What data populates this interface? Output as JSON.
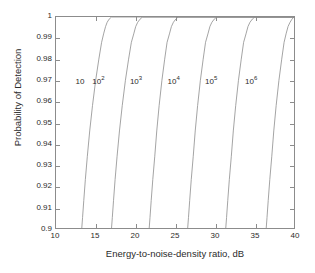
{
  "chart_data": {
    "type": "line",
    "title": "",
    "xlabel": "Energy-to-noise-density ratio, dB",
    "ylabel": "Probability of Detection",
    "xlim": [
      10,
      40
    ],
    "ylim": [
      0.9,
      1.0
    ],
    "xticks": [
      10,
      15,
      20,
      25,
      30,
      35,
      40
    ],
    "xtick_labels": [
      "10",
      "15",
      "20",
      "25",
      "30",
      "35",
      "40"
    ],
    "yticks": [
      0.9,
      0.91,
      0.92,
      0.93,
      0.94,
      0.95,
      0.96,
      0.97,
      0.98,
      0.99,
      1
    ],
    "ytick_labels": [
      "0.9",
      "0.91",
      "0.92",
      "0.93",
      "0.94",
      "0.95",
      "0.96",
      "0.97",
      "0.98",
      "0.99",
      "1"
    ],
    "grid": false,
    "legend": "inline annotations",
    "line_color": "#8c8c8c",
    "axis_color": "#8c8c8c",
    "series": [
      {
        "name": "10",
        "label_base": "10",
        "label_exp": "",
        "label_x": 13.0,
        "label_y": 0.9695,
        "x": [
          13.25,
          13.35,
          13.5,
          13.7,
          13.95,
          14.25,
          14.6,
          15.0,
          15.4,
          15.75,
          16.0,
          16.25,
          16.45,
          16.7,
          17.0,
          40
        ],
        "y": [
          0.9,
          0.905,
          0.913,
          0.923,
          0.934,
          0.946,
          0.958,
          0.97,
          0.98,
          0.988,
          0.992,
          0.9955,
          0.9975,
          0.999,
          1.0,
          1.0
        ]
      },
      {
        "name": "10^2",
        "label_base": "10",
        "label_exp": "2",
        "label_x": 15.3,
        "label_y": 0.9695,
        "x": [
          17.0,
          17.1,
          17.25,
          17.45,
          17.7,
          18.0,
          18.35,
          18.75,
          19.15,
          19.5,
          19.8,
          20.05,
          20.3,
          20.6,
          20.9,
          40
        ],
        "y": [
          0.9,
          0.905,
          0.913,
          0.923,
          0.934,
          0.946,
          0.958,
          0.97,
          0.98,
          0.988,
          0.992,
          0.9955,
          0.9975,
          0.999,
          1.0,
          1.0
        ]
      },
      {
        "name": "10^3",
        "label_base": "10",
        "label_exp": "3",
        "label_x": 20.0,
        "label_y": 0.9695,
        "x": [
          21.75,
          21.85,
          22.0,
          22.2,
          22.45,
          22.7,
          23.0,
          23.35,
          23.7,
          24.0,
          24.3,
          24.55,
          24.8,
          25.1,
          25.4,
          40
        ],
        "y": [
          0.9,
          0.905,
          0.913,
          0.923,
          0.934,
          0.946,
          0.958,
          0.97,
          0.98,
          0.988,
          0.992,
          0.9955,
          0.9975,
          0.999,
          1.0,
          1.0
        ]
      },
      {
        "name": "10^4",
        "label_base": "10",
        "label_exp": "4",
        "label_x": 24.7,
        "label_y": 0.9695,
        "x": [
          26.6,
          26.7,
          26.85,
          27.05,
          27.3,
          27.55,
          27.85,
          28.2,
          28.55,
          28.85,
          29.15,
          29.4,
          29.65,
          29.95,
          30.25,
          40
        ],
        "y": [
          0.9,
          0.905,
          0.913,
          0.923,
          0.934,
          0.946,
          0.958,
          0.97,
          0.98,
          0.988,
          0.992,
          0.9955,
          0.9975,
          0.999,
          1.0,
          1.0
        ]
      },
      {
        "name": "10^5",
        "label_base": "10",
        "label_exp": "5",
        "label_x": 29.4,
        "label_y": 0.9695,
        "x": [
          31.4,
          31.5,
          31.65,
          31.85,
          32.1,
          32.35,
          32.65,
          33.0,
          33.35,
          33.65,
          33.95,
          34.2,
          34.45,
          34.75,
          35.05,
          40
        ],
        "y": [
          0.9,
          0.905,
          0.913,
          0.923,
          0.934,
          0.946,
          0.958,
          0.97,
          0.98,
          0.988,
          0.992,
          0.9955,
          0.9975,
          0.999,
          1.0,
          1.0
        ]
      },
      {
        "name": "10^6",
        "label_base": "10",
        "label_exp": "6",
        "label_x": 34.4,
        "label_y": 0.9695,
        "x": [
          36.5,
          36.6,
          36.75,
          36.95,
          37.2,
          37.45,
          37.75,
          38.1,
          38.45,
          38.75,
          39.0,
          39.25,
          39.5,
          39.75,
          40.0
        ],
        "y": [
          0.9,
          0.905,
          0.913,
          0.923,
          0.934,
          0.946,
          0.958,
          0.97,
          0.98,
          0.988,
          0.992,
          0.9955,
          0.9975,
          0.999,
          1.0
        ]
      }
    ]
  }
}
